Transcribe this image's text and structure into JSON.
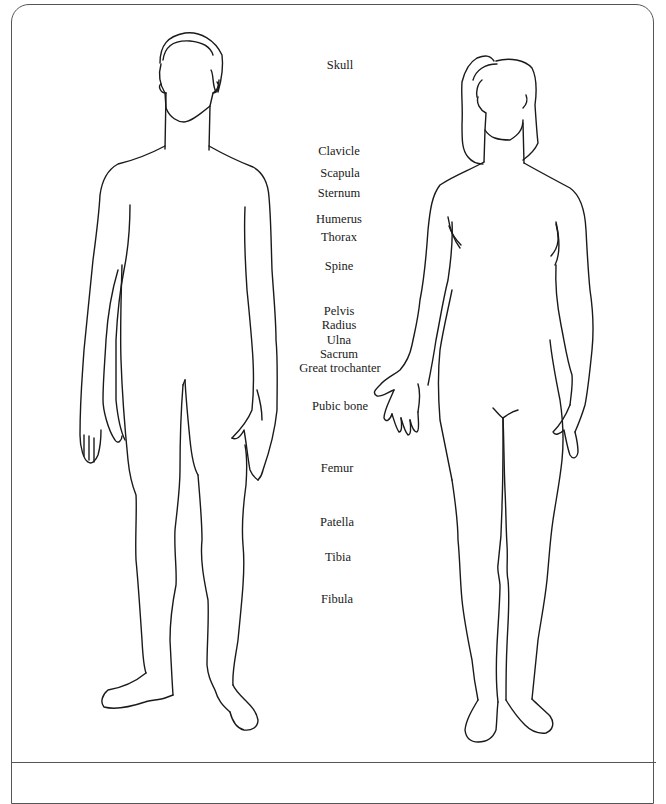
{
  "diagram": {
    "figures": [
      {
        "name": "male-figure",
        "description": "Front view outline of male body"
      },
      {
        "name": "female-figure",
        "description": "Front view outline of female body"
      }
    ],
    "labels": [
      {
        "text": "Skull",
        "x": 340,
        "y": 65
      },
      {
        "text": "Clavicle",
        "x": 339,
        "y": 151
      },
      {
        "text": "Scapula",
        "x": 340,
        "y": 173
      },
      {
        "text": "Sternum",
        "x": 339,
        "y": 193
      },
      {
        "text": "Humerus",
        "x": 339,
        "y": 219
      },
      {
        "text": "Thorax",
        "x": 339,
        "y": 237
      },
      {
        "text": "Spine",
        "x": 339,
        "y": 266
      },
      {
        "text": "Pelvis",
        "x": 339,
        "y": 311
      },
      {
        "text": "Radius",
        "x": 339,
        "y": 325
      },
      {
        "text": "Ulna",
        "x": 339,
        "y": 340
      },
      {
        "text": "Sacrum",
        "x": 339,
        "y": 354
      },
      {
        "text": "Great trochanter",
        "x": 340,
        "y": 368
      },
      {
        "text": "Pubic bone",
        "x": 340,
        "y": 406
      },
      {
        "text": "Femur",
        "x": 337,
        "y": 468
      },
      {
        "text": "Patella",
        "x": 337,
        "y": 522
      },
      {
        "text": "Tibia",
        "x": 338,
        "y": 557
      },
      {
        "text": "Fibula",
        "x": 337,
        "y": 599
      }
    ]
  }
}
